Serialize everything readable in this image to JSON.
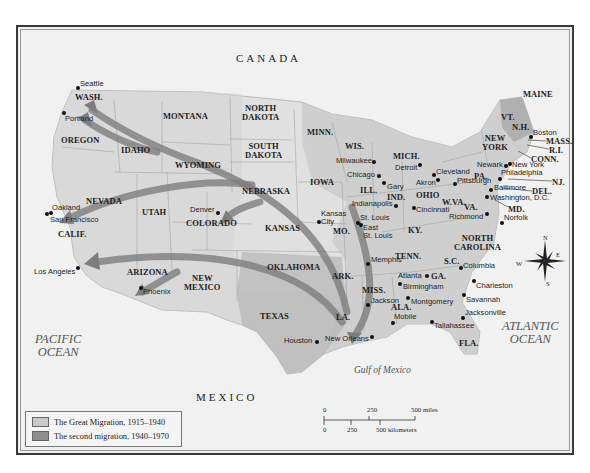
{
  "map": {
    "countries": [
      "CANADA",
      "MEXICO"
    ],
    "oceans": [
      {
        "name": "PACIFIC OCEAN",
        "lines": [
          "PACIFIC",
          "OCEAN"
        ]
      },
      {
        "name": "ATLANTIC OCEAN",
        "lines": [
          "ATLANTIC",
          "OCEAN"
        ]
      }
    ],
    "gulf": "Gulf of Mexico",
    "states": {
      "wash": "WASH.",
      "oregon": "OREGON",
      "idaho": "IDAHO",
      "montana": "MONTANA",
      "wyoming": "WYOMING",
      "north_dakota": "NORTH\nDAKOTA",
      "south_dakota": "SOUTH\nDAKOTA",
      "nebraska": "NEBRASKA",
      "nevada": "NEVADA",
      "utah": "UTAH",
      "colorado": "COLORADO",
      "calif": "CALIF.",
      "kansas": "KANSAS",
      "arizona": "ARIZONA",
      "new_mexico": "NEW\nMEXICO",
      "oklahoma": "OKLAHOMA",
      "texas": "TEXAS",
      "minn": "MINN.",
      "iowa": "IOWA",
      "mo": "MO.",
      "ark": "ARK.",
      "la": "LA.",
      "wis": "WIS.",
      "ill": "ILL.",
      "mich": "MICH.",
      "ind": "IND.",
      "ohio": "OHIO",
      "ky": "KY.",
      "tenn": "TENN.",
      "miss": "MISS.",
      "ala": "ALA.",
      "ga": "GA.",
      "fla": "FLA.",
      "sc": "S.C.",
      "north_carolina": "NORTH\nCAROLINA",
      "va": "VA.",
      "wva": "W.VA.",
      "pa": "PA.",
      "new_york": "NEW\nYORK",
      "vt": "VT.",
      "nh": "N.H.",
      "maine": "MAINE",
      "mass": "MASS.",
      "ri": "R.I.",
      "conn": "CONN.",
      "nj": "NJ.",
      "del": "DEL.",
      "md": "MD."
    },
    "cities": {
      "seattle": "Seattle",
      "portland": "Portland",
      "oakland": "Oakland",
      "san_francisco": "San Francisco",
      "los_angeles": "Los Angeles",
      "phoenix": "Phoenix",
      "denver": "Denver",
      "kansas_city": "Kansas\nCity",
      "houston": "Houston",
      "new_orleans": "New Orleans",
      "memphis": "Memphis",
      "st_louis": "St. Louis",
      "east_st_louis": "East\nSt. Louis",
      "milwaukee": "Milwaukee",
      "chicago": "Chicago",
      "gary": "Gary",
      "indianapolis": "Indianapolis",
      "detroit": "Detroit",
      "cleveland": "Cleveland",
      "akron": "Akron",
      "cincinnati": "Cincinnati",
      "pittsburgh": "Pittsburgh",
      "newark": "Newark",
      "new_york": "New York",
      "philadelphia": "Philadelphia",
      "baltimore": "Baltimore",
      "washington": "Washington, D.C.",
      "richmond": "Richmond",
      "norfolk": "Norfolk",
      "boston": "Boston",
      "atlanta": "Atlanta",
      "birmingham": "Birmingham",
      "jackson": "Jackson",
      "montgomery": "Montgomery",
      "mobile": "Mobile",
      "tallahassee": "Tallahassee",
      "jacksonville": "Jacksonville",
      "savannah": "Savannah",
      "charleston": "Charleston",
      "columbia": "Columbia"
    },
    "compass": {
      "n": "N",
      "s": "S",
      "e": "E",
      "w": "W"
    },
    "colors": {
      "great_migration": "#c9c9c9",
      "second_migration": "#8e8e8e",
      "arrow": "#7d7d7d",
      "land": "#e2e2e2",
      "water": "#f3f3f3"
    }
  },
  "legend": {
    "items": [
      {
        "label": "The Great Migration, 1915–1940",
        "color": "#c9c9c9"
      },
      {
        "label": "The second migration, 1940–1970",
        "color": "#8e8e8e"
      }
    ]
  },
  "scale": {
    "miles": {
      "ticks": [
        "0",
        "250",
        "500 miles"
      ]
    },
    "kilometers": {
      "ticks": [
        "0",
        "250",
        "500 kilometers"
      ]
    }
  }
}
